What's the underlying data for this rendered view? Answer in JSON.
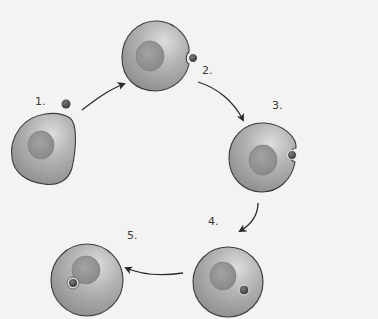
{
  "diagram": {
    "steps": [
      {
        "label": "1.",
        "description": "cell with nearby particle"
      },
      {
        "label": "2.",
        "description": "particle contacts membrane indentation"
      },
      {
        "label": "3.",
        "description": "membrane wraps around particle"
      },
      {
        "label": "4.",
        "description": "particle enclosed at membrane edge"
      },
      {
        "label": "5.",
        "description": "vesicle containing particle inside cell"
      }
    ],
    "colors": {
      "background": "#f3f3f1",
      "cell_fill": "#a9a9a9",
      "cell_highlight": "#d8d8d8",
      "cell_outline": "#3c3c3c",
      "nucleus_fill": "#8f8f8f",
      "particle_fill": "#4a4a4a",
      "arrow": "#2a2a2a"
    }
  }
}
